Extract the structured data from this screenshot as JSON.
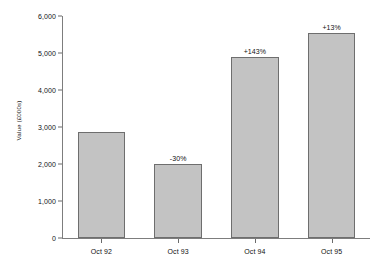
{
  "chart_data": {
    "type": "bar",
    "title": "",
    "xlabel": "",
    "ylabel": "Value (£000s)",
    "categories": [
      "Oct 92",
      "Oct 93",
      "Oct 94",
      "Oct 95"
    ],
    "values": [
      2870,
      2010,
      4890,
      5540
    ],
    "annotations": [
      "",
      "-30%",
      "+143%",
      "+13%"
    ],
    "ylim": [
      0,
      6000
    ],
    "yticks": [
      0,
      1000,
      2000,
      3000,
      4000,
      5000,
      6000
    ],
    "ytick_labels": [
      "0",
      "1,000",
      "2,000",
      "3,000",
      "4,000",
      "5,000",
      "6,000"
    ],
    "grid": false,
    "legend": null,
    "bar_fill_color": "#c3c3c3",
    "bar_border_color": "#6e6e6e",
    "axis_color": "#7d7d7d",
    "text_color": "#111111",
    "background_color": "#ffffff"
  }
}
